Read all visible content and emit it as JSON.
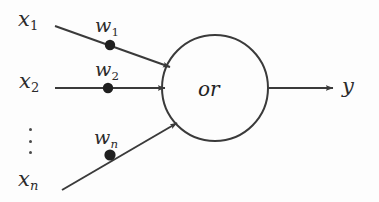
{
  "figure": {
    "type": "neural-network-unit-diagram",
    "background_color": "#fdfdfd",
    "ink_color": "#3a3a3a"
  },
  "node": {
    "label": "or",
    "center_x": 215,
    "center_y": 88,
    "radius": 53
  },
  "inputs": [
    {
      "label_base": "x",
      "label_sub": "1",
      "x": 18,
      "y": 9
    },
    {
      "label_base": "x",
      "label_sub": "2",
      "x": 19,
      "y": 71
    },
    {
      "label_base": "x",
      "label_sub": "n",
      "x": 18,
      "y": 169
    }
  ],
  "weights": [
    {
      "label_base": "w",
      "label_sub": "1",
      "x": 95,
      "y": 16,
      "dot_x": 110,
      "dot_y": 45
    },
    {
      "label_base": "w",
      "label_sub": "2",
      "x": 95,
      "y": 60,
      "dot_x": 108,
      "dot_y": 88
    },
    {
      "label_base": "w",
      "label_sub": "n",
      "x": 94,
      "y": 128,
      "dot_x": 110,
      "dot_y": 155
    }
  ],
  "output": {
    "label": "y",
    "x": 342,
    "y": 76
  },
  "ellipsis": {
    "name": "vertical-ellipsis",
    "x": 28,
    "y": 128,
    "dot_count": 3
  }
}
